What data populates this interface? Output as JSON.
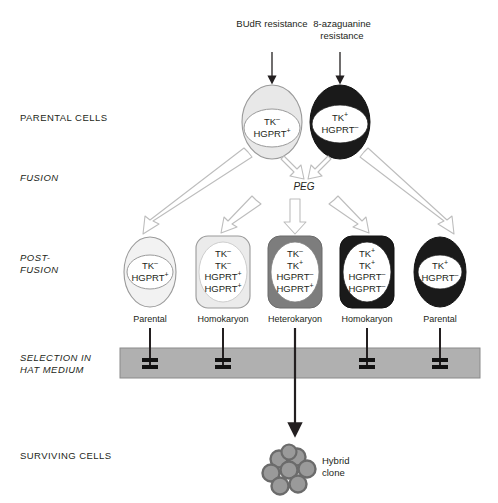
{
  "figure": {
    "background_color": "#ffffff",
    "text_color": "#231f20"
  },
  "stage_labels": [
    {
      "id": "parental-cells",
      "text": "PARENTAL CELLS",
      "italic": false,
      "x": 20,
      "y": 112
    },
    {
      "id": "fusion",
      "text": "FUSION",
      "italic": true,
      "x": 20,
      "y": 172
    },
    {
      "id": "post-fusion",
      "text": "POST-\nFUSION",
      "italic": true,
      "x": 20,
      "y": 252
    },
    {
      "id": "selection-hat",
      "text": "SELECTION IN\nHAT MEDIUM",
      "italic": true,
      "x": 20,
      "y": 352
    },
    {
      "id": "surviving-cells",
      "text": "SURVIVING CELLS",
      "italic": false,
      "x": 20,
      "y": 450
    }
  ],
  "treatments": [
    {
      "id": "budr",
      "text": "BUdR\nresistance",
      "x": 242,
      "y": 18,
      "arrow_x": 272,
      "arrow_top": 50,
      "arrow_bottom": 84
    },
    {
      "id": "8-azaguanine",
      "text": "8-azaguanine\nresistance",
      "x": 310,
      "y": 18,
      "arrow_x": 340,
      "arrow_top": 50,
      "arrow_bottom": 84
    }
  ],
  "parental_cells": [
    {
      "id": "parent-tk-minus",
      "fill": "#e8e8e8",
      "stroke": "#9a9a9a",
      "nucleus_fill": "#ffffff",
      "cx": 272,
      "cy": 122,
      "rx": 30,
      "ry": 37,
      "nucleus_rx": 28,
      "nucleus_ry": 19,
      "nucleus_cy": 128,
      "genotype": [
        "TK−",
        "HGPRT+"
      ]
    },
    {
      "id": "parent-hgprt-minus",
      "fill": "#1a1a1a",
      "stroke": "#111111",
      "nucleus_fill": "#ffffff",
      "cx": 340,
      "cy": 122,
      "rx": 30,
      "ry": 37,
      "nucleus_rx": 28,
      "nucleus_ry": 19,
      "nucleus_cy": 124,
      "genotype": [
        "TK+",
        "HGPRT−"
      ]
    }
  ],
  "peg_box": {
    "label": "PEG",
    "x": 218,
    "y": 180,
    "width": 172,
    "height": 15,
    "fill": "#ececec",
    "stroke": "#8a8a8a"
  },
  "postfusion_cells": [
    {
      "id": "postfusion-parental-left",
      "type_label": "Parental",
      "shape": "ellipse",
      "fill": "#f2f2f2",
      "stroke": "#9a9a9a",
      "cx": 150,
      "cy": 272,
      "rx": 26,
      "ry": 35,
      "nucleus_rx": 23,
      "nucleus_ry": 17,
      "nucleus_cy": 272,
      "genotype": [
        "TK−",
        "HGPRT+"
      ],
      "label_y": 316,
      "blocked": true
    },
    {
      "id": "postfusion-homokaryon-left",
      "type_label": "Homokaryon",
      "shape": "rounded-rect",
      "fill": "#ebebeb",
      "stroke": "#9a9a9a",
      "x": 196,
      "y": 236,
      "width": 54,
      "height": 72,
      "radius": 12,
      "nucleus_rx": 24,
      "nucleus_ry": 30,
      "nucleus_cx": 223,
      "nucleus_cy": 272,
      "genotype": [
        "TK−",
        "TK−",
        "HGPRT+",
        "HGPRT+"
      ],
      "label_y": 316,
      "blocked": true
    },
    {
      "id": "postfusion-heterokaryon",
      "type_label": "Heterokaryon",
      "shape": "rounded-rect",
      "fill": "#7d7d7d",
      "stroke": "#6a6a6a",
      "x": 268,
      "y": 236,
      "width": 54,
      "height": 72,
      "radius": 12,
      "nucleus_rx": 24,
      "nucleus_ry": 30,
      "nucleus_cx": 295,
      "nucleus_cy": 272,
      "genotype": [
        "TK−",
        "TK+",
        "HGPRT−",
        "HGPRT+"
      ],
      "label_y": 316,
      "blocked": false
    },
    {
      "id": "postfusion-homokaryon-right",
      "type_label": "Homokaryon",
      "shape": "rounded-rect",
      "fill": "#1a1a1a",
      "stroke": "#111111",
      "x": 340,
      "y": 236,
      "width": 54,
      "height": 72,
      "radius": 12,
      "nucleus_rx": 24,
      "nucleus_ry": 30,
      "nucleus_cx": 367,
      "nucleus_cy": 272,
      "genotype": [
        "TK+",
        "TK+",
        "HGPRT−",
        "HGPRT−"
      ],
      "label_y": 316,
      "blocked": true
    },
    {
      "id": "postfusion-parental-right",
      "type_label": "Parental",
      "shape": "ellipse",
      "fill": "#1a1a1a",
      "stroke": "#111111",
      "cx": 440,
      "cy": 272,
      "rx": 26,
      "ry": 35,
      "nucleus_rx": 22,
      "nucleus_ry": 17,
      "nucleus_cy": 272,
      "genotype": [
        "TK+",
        "HGPRT−"
      ],
      "label_y": 316,
      "blocked": true
    }
  ],
  "hat_band": {
    "x": 120,
    "y": 348,
    "width": 360,
    "height": 30,
    "fill": "#b0b0b0",
    "stroke": "#8a8a8a"
  },
  "hybrid_clone": {
    "label": "Hybrid\nclone",
    "label_x": 322,
    "label_y": 455,
    "cluster_cx": 290,
    "cluster_cy": 470,
    "cell_fill": "#9a9a9a",
    "cell_ring": "#6b6b6b",
    "cell_count": 8
  },
  "arrow_colors": {
    "hollow_fill": "#ffffff",
    "hollow_stroke": "#b8b8b8",
    "solid": "#231f20"
  }
}
